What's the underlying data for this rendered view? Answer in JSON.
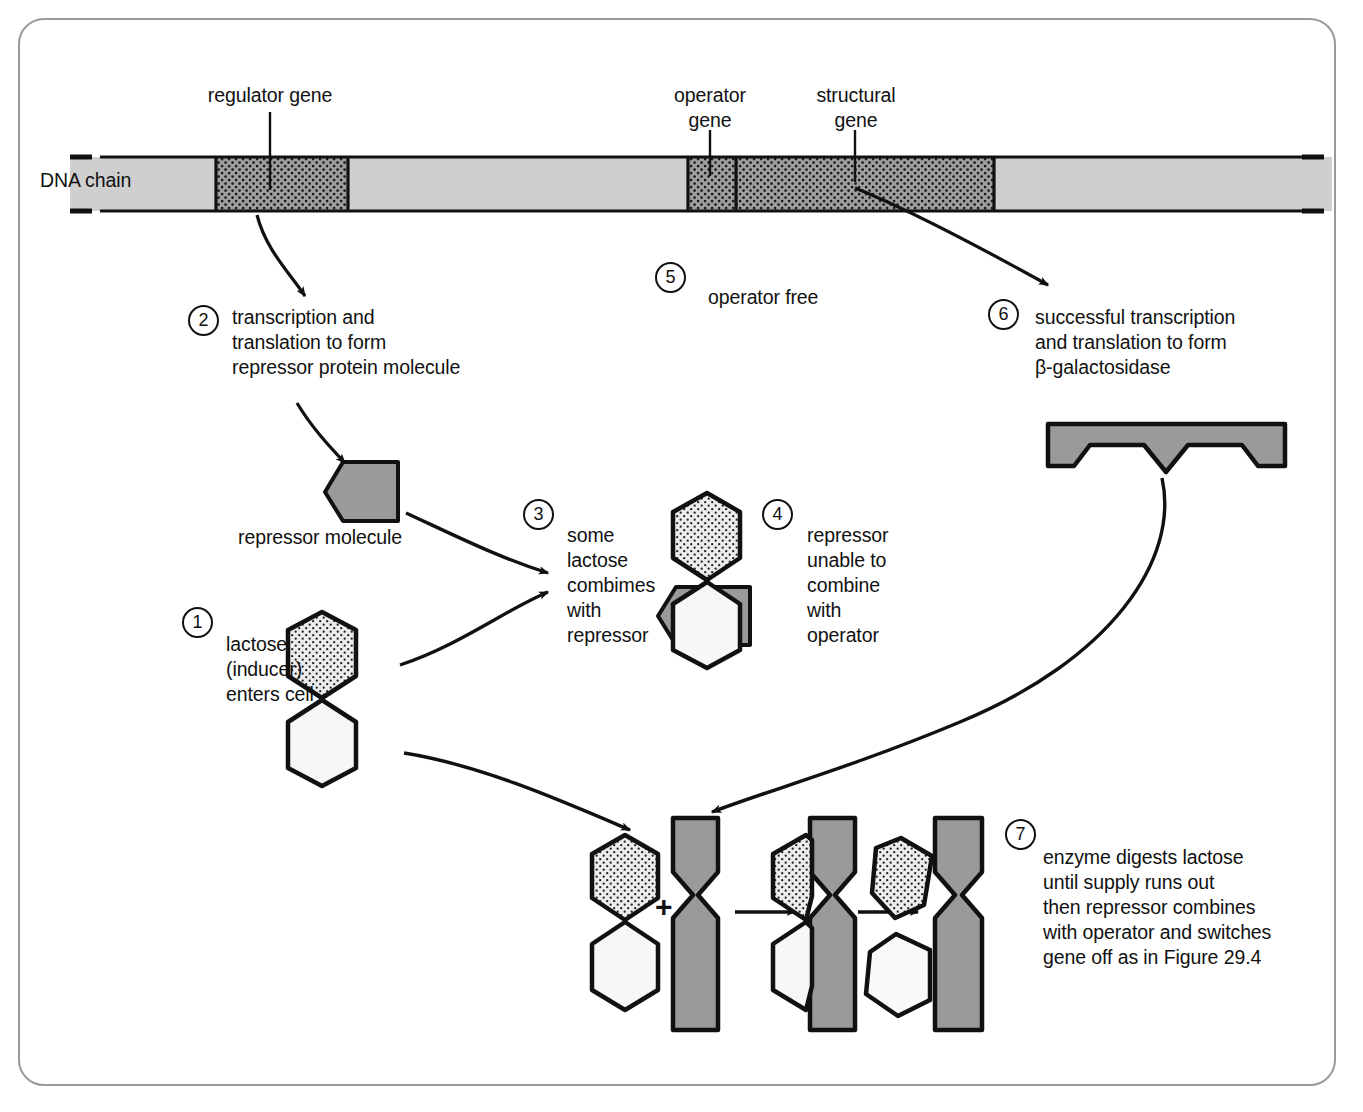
{
  "figure": {
    "colors": {
      "dna_light": "#cfcfcf",
      "dna_dark": "#9e9e9e",
      "repressor_fill": "#9a9a9a",
      "lactose_top_fill": "#e8e8e8",
      "lactose_bottom_fill": "#f4f4f4",
      "enzyme_fill": "#9a9a9a",
      "outline": "#111111",
      "border": "#9a9a9a"
    }
  },
  "dna": {
    "chain_label": "DNA chain",
    "segments": [
      {
        "name": "regulator gene",
        "label": "regulator gene",
        "shade": "dark-dotted"
      },
      {
        "name": "operator gene",
        "label": "operator\ngene",
        "shade": "dark-dotted"
      },
      {
        "name": "structural gene",
        "label": "structural\ngene",
        "shade": "dark-dotted"
      }
    ],
    "labels": {
      "regulator_gene": "regulator gene",
      "operator_gene_line1": "operator",
      "operator_gene_line2": "gene",
      "structural_gene_line1": "structural",
      "structural_gene_line2": "gene"
    }
  },
  "steps": [
    {
      "number": "1",
      "text": "lactose\n(inducer)\nenters cell"
    },
    {
      "number": "2",
      "text": "transcription and\ntranslation to form\nrepressor protein molecule"
    },
    {
      "number": "3",
      "text": "some\nlactose\ncombimes\nwith\nrepressor"
    },
    {
      "number": "4",
      "text": "repressor\nunable to\ncombine\nwith\noperator"
    },
    {
      "number": "5",
      "text": "operator free"
    },
    {
      "number": "6",
      "text": "successful transcription\nand translation to form\nβ-galactosidase"
    },
    {
      "number": "7",
      "text": "enzyme digests lactose\nuntil supply runs out\nthen repressor combines\nwith operator and switches\ngene off as in Figure 29.4"
    }
  ],
  "molecules": {
    "repressor_molecule_label": "repressor molecule",
    "plus_sign": "+"
  }
}
